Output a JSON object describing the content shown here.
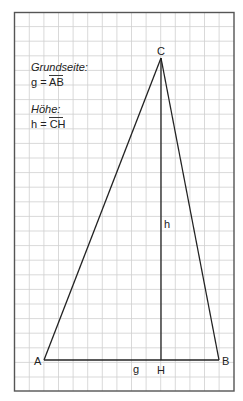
{
  "legend": {
    "base_label": "Grundseite:",
    "base_formula_prefix": "g = ",
    "base_formula_segment": "AB",
    "height_label": "Höhe:",
    "height_formula_prefix": "h = ",
    "height_formula_segment": "CH"
  },
  "vertices": {
    "A": "A",
    "B": "B",
    "C": "C",
    "H": "H"
  },
  "segments": {
    "base": "g",
    "height": "h"
  },
  "colors": {
    "grid": "#c9c9c9",
    "border": "#555555",
    "lines": "#222222"
  }
}
